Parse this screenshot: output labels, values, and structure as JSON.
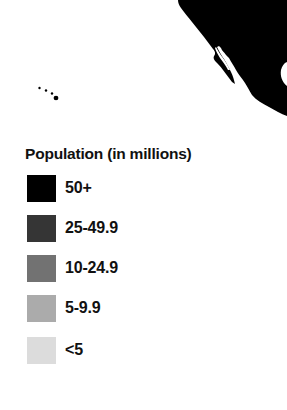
{
  "map": {
    "region": "Western North America (Mexico / US Pacific coast) and Hawaii",
    "land_color": "#000000",
    "water_color": "#ffffff"
  },
  "legend": {
    "title": "Population (in millions)",
    "items": [
      {
        "label": "50+",
        "color": "#000000"
      },
      {
        "label": "25-49.9",
        "color": "#353535"
      },
      {
        "label": "10-24.9",
        "color": "#727272"
      },
      {
        "label": "5-9.9",
        "color": "#ababab"
      },
      {
        "label": "<5",
        "color": "#dcdcdc"
      }
    ]
  }
}
